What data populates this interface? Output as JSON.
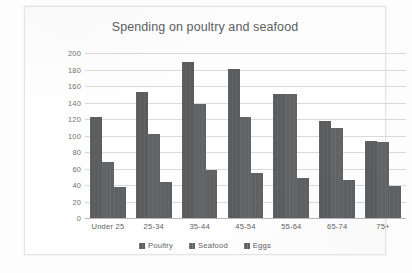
{
  "chart_data": {
    "type": "bar",
    "title": "Spending on poultry and seafood",
    "xlabel": "",
    "ylabel": "",
    "ylim": [
      0,
      200
    ],
    "ytick_step": 20,
    "yticks": [
      200,
      180,
      160,
      140,
      120,
      100,
      80,
      60,
      40,
      20,
      0
    ],
    "grid": true,
    "legend_position": "bottom",
    "categories": [
      "Under 25",
      "25-34",
      "35-44",
      "45-54",
      "55-64",
      "65-74",
      "75+"
    ],
    "series": [
      {
        "name": "Poultry",
        "color": "#5b5c5e",
        "values": [
          122,
          153,
          189,
          181,
          150,
          117,
          93
        ]
      },
      {
        "name": "Seafood",
        "color": "#626365",
        "values": [
          68,
          102,
          138,
          123,
          150,
          109,
          92
        ]
      },
      {
        "name": "Eggs",
        "color": "#5f6062",
        "values": [
          38,
          44,
          58,
          54,
          48,
          46,
          39
        ]
      }
    ]
  }
}
